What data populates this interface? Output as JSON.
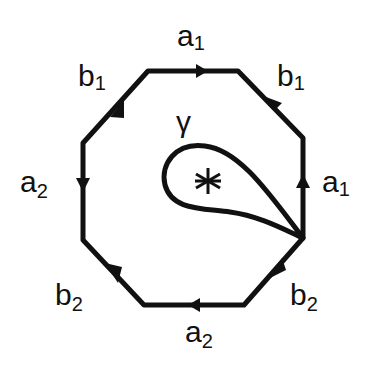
{
  "diagram": {
    "title": "",
    "shape": "octagon",
    "curve_label": "γ",
    "center_symbol": "∗",
    "edges": [
      {
        "id": "top",
        "label": "a",
        "sub": "1",
        "arrow": "right"
      },
      {
        "id": "upper-right",
        "label": "b",
        "sub": "1",
        "arrow": "up-left"
      },
      {
        "id": "right",
        "label": "a",
        "sub": "1",
        "arrow": "up"
      },
      {
        "id": "lower-right",
        "label": "b",
        "sub": "2",
        "arrow": "down-left"
      },
      {
        "id": "bottom",
        "label": "a",
        "sub": "2",
        "arrow": "left"
      },
      {
        "id": "lower-left",
        "label": "b",
        "sub": "2",
        "arrow": "down-right"
      },
      {
        "id": "left",
        "label": "a",
        "sub": "2",
        "arrow": "down"
      },
      {
        "id": "upper-left",
        "label": "b",
        "sub": "1",
        "arrow": "up-right"
      }
    ],
    "colors": {
      "stroke": "#111111",
      "background": "#ffffff"
    }
  }
}
